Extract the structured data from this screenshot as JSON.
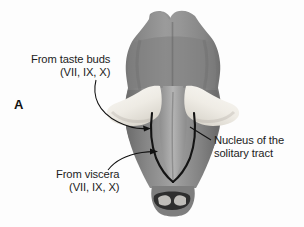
{
  "figure": {
    "panel_letter": "A",
    "background_color": "#fdfdfd",
    "text_color": "#1c1c1c"
  },
  "labels": {
    "taste": {
      "line1": "From taste buds",
      "line2": "(VII, IX, X)"
    },
    "viscera": {
      "line1": "From viscera",
      "line2": "(VII, IX, X)"
    },
    "nucleus": {
      "line1": "Nucleus of the",
      "line2": "solitary tract"
    }
  },
  "anatomy": {
    "specimen_fill_mid": "#8d8d8d",
    "specimen_fill_dark": "#6f6f6f",
    "specimen_fill_light": "#b9b9b9",
    "peduncle_fill": "#f4f2ee",
    "tract_outline_color": "#141414",
    "cord_stump_fill": "#3a3a3a",
    "parts": [
      "midbrain-colliculi",
      "pons",
      "cerebellar-peduncle-left",
      "cerebellar-peduncle-right",
      "fourth-ventricle-floor",
      "medulla",
      "nucleus-tractus-solitarius",
      "spinal-cord-stump"
    ]
  },
  "leaders": {
    "taste_arrow": "curved-leader-with-arrowhead",
    "viscera_arrow": "curved-leader-with-arrowhead",
    "nucleus_line": "straight-leader-no-arrowhead"
  }
}
